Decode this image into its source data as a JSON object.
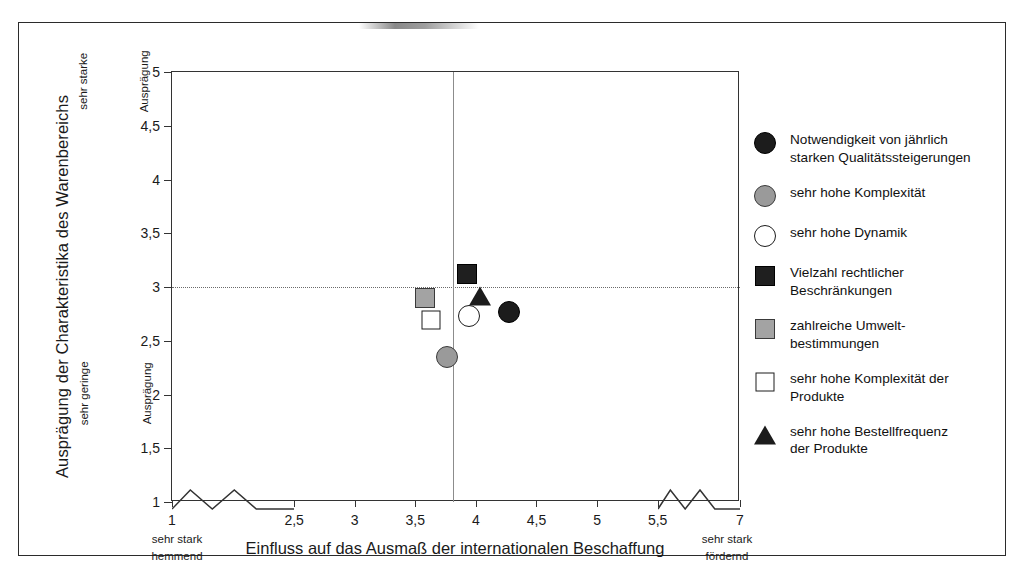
{
  "chart_data": {
    "type": "scatter",
    "title": "",
    "xlabel": "Einfluss auf das Ausmaß der internationalen Beschaffung",
    "ylabel": "Ausprägung der Charakteristika des Warenbereichs",
    "xlim": [
      1,
      7
    ],
    "ylim": [
      1,
      5
    ],
    "grid": false,
    "legend_position": "right",
    "x_ticks": [
      "1",
      "2,5",
      "3",
      "3,5",
      "4",
      "4,5",
      "5",
      "5,5",
      "7"
    ],
    "x_tick_values": [
      1,
      2.5,
      3,
      3.5,
      4,
      4.5,
      5,
      5.5,
      7
    ],
    "y_ticks": [
      "1",
      "1,5",
      "2",
      "2,5",
      "3",
      "3,5",
      "4",
      "4,5",
      "5"
    ],
    "y_tick_values": [
      1,
      1.5,
      2,
      2.5,
      3,
      3.5,
      4,
      4.5,
      5
    ],
    "axis_breaks": {
      "x_left": "1 bis 2,5",
      "x_right": "5,5 bis 7"
    },
    "reference_lines": {
      "vertical_x": 4,
      "horizontal_y": 3
    },
    "x_end_label_left": "sehr stark\nhemmend",
    "x_end_label_right": "sehr stark\nfördernd",
    "y_end_label_top": "sehr starke\nAusprägung",
    "y_end_label_bottom": "sehr geringe\nAusprägung",
    "points": [
      {
        "label": "Notwendigkeit von jährlich starken Qualitätssteigerungen",
        "x": 4.27,
        "y": 2.77,
        "marker": "circle-filled"
      },
      {
        "label": "sehr hohe Komplexität",
        "x": 3.76,
        "y": 2.35,
        "marker": "circle-gray"
      },
      {
        "label": "sehr hohe Dynamik",
        "x": 3.94,
        "y": 2.73,
        "marker": "circle-open"
      },
      {
        "label": "Vielzahl rechtlicher Beschränkungen",
        "x": 3.93,
        "y": 3.12,
        "marker": "square-filled"
      },
      {
        "label": "zahlreiche Umweltbestimmungen",
        "x": 3.58,
        "y": 2.9,
        "marker": "square-gray"
      },
      {
        "label": "sehr hohe Komplexität der Produkte",
        "x": 3.63,
        "y": 2.69,
        "marker": "square-open"
      },
      {
        "label": "sehr hohe Bestellfrequenz der Produkte",
        "x": 4.03,
        "y": 2.92,
        "marker": "triangle-filled"
      }
    ]
  },
  "axis": {
    "y_title": "Ausprägung der Charakteristika des Warenbereichs",
    "x_title": "Einfluss auf das Ausmaß der internationalen Beschaffung",
    "y_top_line1": "sehr starke",
    "y_top_line2": "Ausprägung",
    "y_bottom_line1": "sehr geringe",
    "y_bottom_line2": "Ausprägung",
    "x_left_end": "sehr stark\nhemmend",
    "x_right_end": "sehr stark\nfördernd",
    "y_labels": [
      "5",
      "4,5",
      "4",
      "3,5",
      "3",
      "2,5",
      "2",
      "1,5",
      "1"
    ],
    "x_labels": [
      "1",
      "2,5",
      "3",
      "3,5",
      "4",
      "4,5",
      "5",
      "5,5",
      "7"
    ]
  },
  "legend": {
    "items": [
      {
        "marker": "circle-filled",
        "label": "Notwendigkeit von jährlich\nstarken Qualitätssteigerungen"
      },
      {
        "marker": "circle-gray",
        "label": "sehr hohe Komplexität"
      },
      {
        "marker": "circle-open",
        "label": "sehr hohe Dynamik"
      },
      {
        "marker": "square-filled",
        "label": "Vielzahl rechtlicher\nBeschränkungen"
      },
      {
        "marker": "square-gray",
        "label": "zahlreiche Umwelt-\nbestimmungen"
      },
      {
        "marker": "square-open",
        "label": "sehr hohe Komplexität der\nProdukte"
      },
      {
        "marker": "triangle-filled",
        "label": "sehr hohe Bestellfrequenz\nder Produkte"
      }
    ]
  },
  "colors": {
    "marker_dark": "#1c1c1c",
    "marker_gray": "#9a9a9a",
    "marker_open": "#ffffff",
    "axis": "#333333",
    "frame": "#2b2b2b"
  }
}
